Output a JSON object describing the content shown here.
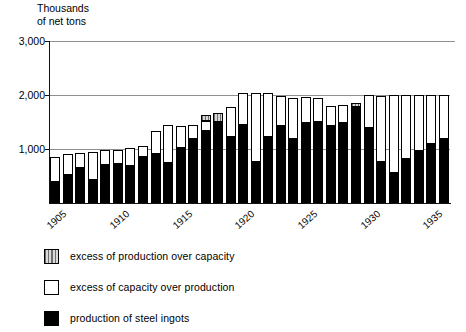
{
  "chart_data": {
    "type": "bar",
    "title": "",
    "ylabel": "Thousands\nof net tons",
    "xlabel": "",
    "ylim": [
      0,
      3000
    ],
    "yticks": [
      1000,
      2000,
      3000
    ],
    "ytick_labels": [
      "1,000",
      "2,000",
      "3,000"
    ],
    "grid": true,
    "legend_position": "below",
    "x": [
      1905,
      1906,
      1907,
      1908,
      1909,
      1910,
      1911,
      1912,
      1913,
      1914,
      1915,
      1916,
      1917,
      1918,
      1919,
      1920,
      1921,
      1922,
      1923,
      1924,
      1925,
      1926,
      1927,
      1928,
      1929,
      1930,
      1931,
      1932,
      1933,
      1934,
      1935,
      1936
    ],
    "xtick_labels": [
      "1905",
      "1910",
      "1915",
      "1920",
      "1925",
      "1930",
      "1935"
    ],
    "xticks": [
      1905,
      1910,
      1915,
      1920,
      1925,
      1930,
      1935
    ],
    "series": [
      {
        "name": "production of steel ingots",
        "key": "production",
        "color": "#000000",
        "values": [
          380,
          520,
          640,
          420,
          700,
          720,
          680,
          860,
          900,
          740,
          1020,
          1180,
          1340,
          1500,
          1220,
          1450,
          760,
          1230,
          1430,
          1190,
          1480,
          1500,
          1430,
          1480,
          1780,
          1380,
          760,
          560,
          820,
          960,
          1090,
          1180
        ]
      },
      {
        "name": "excess of capacity over production",
        "key": "capacity_excess",
        "color": "#ffffff",
        "values": [
          480,
          390,
          280,
          530,
          280,
          270,
          330,
          200,
          430,
          700,
          400,
          270,
          180,
          0,
          560,
          590,
          1270,
          800,
          560,
          760,
          480,
          440,
          360,
          330,
          0,
          620,
          1230,
          1440,
          1180,
          1040,
          910,
          820
        ]
      },
      {
        "name": "excess of production over capacity",
        "key": "production_excess",
        "color": "#9a9a9a",
        "values": [
          0,
          0,
          0,
          0,
          0,
          0,
          0,
          0,
          0,
          0,
          0,
          0,
          110,
          170,
          0,
          0,
          0,
          0,
          0,
          0,
          0,
          0,
          0,
          0,
          70,
          0,
          0,
          0,
          0,
          0,
          0,
          0
        ]
      }
    ],
    "capacity_total": [
      860,
      910,
      920,
      950,
      980,
      990,
      1010,
      1060,
      1330,
      1440,
      1420,
      1450,
      1410,
      1500,
      1780,
      2040,
      2030,
      2030,
      1990,
      1950,
      1960,
      1940,
      1790,
      1810,
      1780,
      2000,
      1990,
      2000,
      2000,
      2000,
      2000,
      2000
    ]
  },
  "legend": {
    "items": [
      {
        "label": "excess of production  over capacity",
        "swatch": "hatched-gray"
      },
      {
        "label": "excess of capacity  over production",
        "swatch": "white"
      },
      {
        "label": "production of steel ingots",
        "swatch": "black"
      }
    ]
  }
}
